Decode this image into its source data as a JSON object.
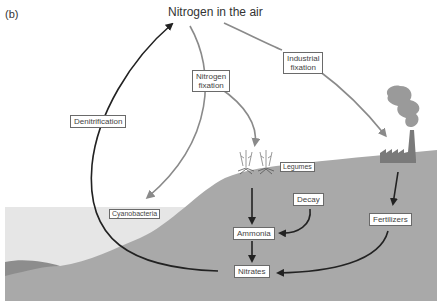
{
  "panel_label": "(b)",
  "title": "Nitrogen in the air",
  "labels": {
    "denitrification": "Denitrification",
    "nitrogen_fixation_line1": "Nitrogen",
    "nitrogen_fixation_line2": "fixation",
    "industrial_fixation_line1": "Industrial",
    "industrial_fixation_line2": "fixation",
    "legumes": "Legumes",
    "cyanobacteria": "Cyanobacteria",
    "decay": "Decay",
    "ammonia": "Ammonia",
    "fertilizers": "Fertilizers",
    "nitrates": "Nitrates"
  },
  "colors": {
    "land": "#a9a9a9",
    "water": "#e6e6e6",
    "seabed_dark": "#8d8d8d",
    "dark_arrow": "#222222",
    "light_arrow": "#8a8a8a",
    "factory": "#7a7a7a",
    "smoke": "#9a9a9a"
  },
  "icons": [
    "factory-icon",
    "smoke-icon",
    "legume-plant-icon"
  ]
}
